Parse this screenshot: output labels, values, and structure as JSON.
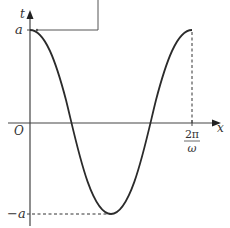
{
  "diagram": {
    "type": "cosine-graph",
    "axes": {
      "x_label": "x",
      "y_label": "t",
      "origin_label": "O"
    },
    "y_ticks": {
      "top": "a",
      "bottom": "−a"
    },
    "x_tick": {
      "numerator": "2π",
      "denominator": "ω"
    },
    "curve": {
      "description": "t = a·cos(ωx) over one period from 0 to 2π/ω",
      "color": "#2b2b2b"
    },
    "axis_color": "#444444"
  }
}
